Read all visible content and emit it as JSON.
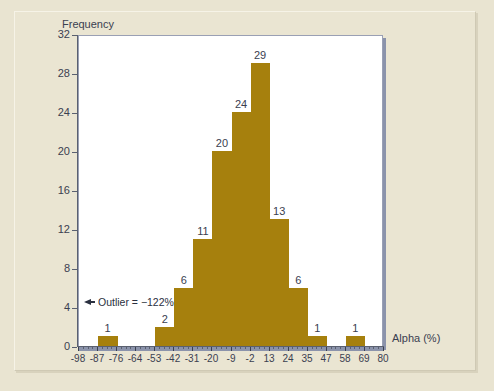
{
  "chart_data": {
    "type": "bar",
    "title": "",
    "xlabel": "Alpha (%)",
    "ylabel": "Frequency",
    "ylim": [
      0,
      32
    ],
    "ytick_labels": [
      "0",
      "4",
      "8",
      "12",
      "16",
      "20",
      "24",
      "28",
      "32"
    ],
    "ytick_values": [
      0,
      4,
      8,
      12,
      16,
      20,
      24,
      28,
      32
    ],
    "xtick_labels": [
      "-98",
      "-87",
      "-76",
      "-64",
      "-53",
      "-42",
      "-31",
      "-20",
      "-9",
      "-2",
      "13",
      "24",
      "35",
      "47",
      "58",
      "69",
      "80"
    ],
    "xtick_values": [
      -98,
      -87,
      -76,
      -64,
      -53,
      -42,
      -31,
      -20,
      -9,
      -2,
      13,
      24,
      35,
      47,
      58,
      69,
      80
    ],
    "grid": false,
    "legend": null,
    "bar_color": "#a6800d",
    "categories": [
      "-98..-87",
      "-87..-76",
      "-76..-64",
      "-64..-53",
      "-53..-42",
      "-42..-31",
      "-31..-20",
      "-20..-9",
      "-9..-2",
      "-2..13",
      "13..24",
      "24..35",
      "35..47",
      "47..58",
      "58..69",
      "69..80"
    ],
    "values": [
      0,
      1,
      0,
      0,
      2,
      6,
      11,
      20,
      24,
      29,
      13,
      6,
      1,
      0,
      1,
      0
    ],
    "bar_value_labels": [
      "",
      "1",
      "",
      "",
      "2",
      "6",
      "11",
      "20",
      "24",
      "29",
      "13",
      "6",
      "1",
      "",
      "1",
      ""
    ],
    "annotations": [
      {
        "text": "Outlier = −122%",
        "arrow": "left"
      }
    ]
  },
  "axis": {
    "y_title": "Frequency",
    "x_title": "Alpha (%)"
  },
  "annotation": {
    "outlier_text": "Outlier = −122%"
  },
  "colors": {
    "bar": "#a6800d",
    "panel_background": "#ffffff",
    "page_background": "#e9e4d1",
    "axis": "#5a6070",
    "text": "#3a4050"
  }
}
